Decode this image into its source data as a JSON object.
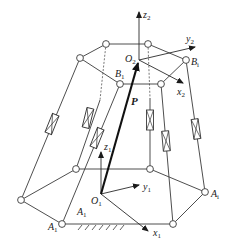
{
  "diagram": {
    "title": "",
    "labels": {
      "z2": {
        "base": "z",
        "sub": "2"
      },
      "y2": {
        "base": "y",
        "sub": "2"
      },
      "x2": {
        "base": "x",
        "sub": "2"
      },
      "O2": {
        "base": "O",
        "sub": "2"
      },
      "B1": {
        "base": "B",
        "sub": "1"
      },
      "Bi": {
        "base": "B",
        "sub": "i"
      },
      "P": "P",
      "z1": {
        "base": "z",
        "sub": "1"
      },
      "y1": {
        "base": "y",
        "sub": "1"
      },
      "x1": {
        "base": "x",
        "sub": "1"
      },
      "O1": {
        "base": "O",
        "sub": "1"
      },
      "A1_inner": {
        "base": "A",
        "sub": "1"
      },
      "A1_corner": {
        "base": "A",
        "sub": "1"
      },
      "Ai": {
        "base": "A",
        "sub": "i"
      }
    },
    "platform_joints": [
      [
        106,
        44
      ],
      [
        148,
        44
      ],
      [
        186,
        60
      ],
      [
        161,
        84
      ],
      [
        120,
        84
      ],
      [
        80,
        58
      ]
    ],
    "base_joints": [
      [
        76,
        169
      ],
      [
        150,
        169
      ],
      [
        205,
        192
      ],
      [
        173,
        224
      ],
      [
        62,
        224
      ],
      [
        21,
        200
      ]
    ],
    "colors": {
      "line": "#3a3a3a",
      "vector": "#111111",
      "background": "#ffffff"
    }
  }
}
